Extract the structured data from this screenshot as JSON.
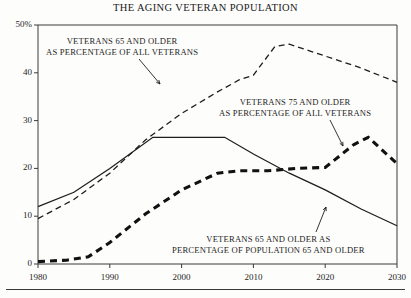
{
  "chart_data": {
    "type": "line",
    "title": "THE AGING VETERAN POPULATION",
    "xlabel": "",
    "ylabel": "",
    "xlim": [
      1980,
      2030
    ],
    "ylim": [
      0,
      50
    ],
    "xticks": [
      1980,
      1990,
      2000,
      2010,
      2020,
      2030
    ],
    "xticklabels": [
      "1980",
      "1990",
      "2000",
      "2010",
      "2020",
      "2030"
    ],
    "yticks": [
      0,
      10,
      20,
      30,
      40,
      50
    ],
    "yticklabels": [
      "0",
      "10",
      "20",
      "30",
      "40",
      "50%"
    ],
    "grid": false,
    "legend_position": "annotations-inline",
    "series": [
      {
        "name": "VETERANS 65 AND OLDER AS PERCENTAGE OF ALL VETERANS",
        "style": "thin-dashed",
        "color": "#1d1d1f",
        "x": [
          1980,
          1985,
          1990,
          1995,
          2000,
          2005,
          2008,
          2010,
          2013,
          2015,
          2018,
          2020,
          2025,
          2030
        ],
        "y": [
          9.5,
          13.5,
          19.0,
          26.0,
          31.5,
          36.0,
          38.5,
          39.5,
          45.5,
          46.0,
          44.5,
          43.5,
          41.0,
          38.0
        ]
      },
      {
        "name": "VETERANS 75 AND OLDER AS PERCENTAGE OF ALL VETERANS",
        "style": "thick-dashed",
        "color": "#111113",
        "x": [
          1980,
          1984,
          1987,
          1990,
          1995,
          2000,
          2005,
          2008,
          2012,
          2016,
          2020,
          2024,
          2026,
          2030
        ],
        "y": [
          0.5,
          0.8,
          1.5,
          4.5,
          10.5,
          15.5,
          19.0,
          19.5,
          19.5,
          20.0,
          20.2,
          25.0,
          26.5,
          21.0
        ]
      },
      {
        "name": "VETERANS 65 AND OLDER AS PERCENTAGE OF POPULATION 65 AND OLDER",
        "style": "solid",
        "color": "#1d1d1f",
        "x": [
          1980,
          1985,
          1990,
          1996,
          2000,
          2006,
          2010,
          2015,
          2020,
          2025,
          2030
        ],
        "y": [
          12.0,
          15.0,
          20.0,
          26.5,
          26.5,
          26.5,
          23.0,
          19.0,
          15.5,
          11.5,
          8.0
        ]
      }
    ],
    "annotations": [
      {
        "id": "ann-0",
        "lines": [
          "VETERANS 65 AND OLDER",
          "AS PERCENTAGE OF ALL VETERANS"
        ],
        "leader_from": [
          139,
          59
        ],
        "leader_to": [
          160,
          84
        ]
      },
      {
        "id": "ann-1",
        "lines": [
          "VETERANS 75 AND OLDER",
          "AS PERCENTAGE OF ALL VETERANS"
        ],
        "leader_from": [
          330,
          120
        ],
        "leader_to": [
          343,
          146
        ]
      },
      {
        "id": "ann-2",
        "lines": [
          "VETERANS 65 AND OLDER AS",
          "PERCENTAGE OF POPULATION 65 AND OLDER"
        ],
        "leader_from": [
          316,
          232
        ],
        "leader_to": [
          326,
          207
        ]
      }
    ],
    "source_note": ""
  }
}
